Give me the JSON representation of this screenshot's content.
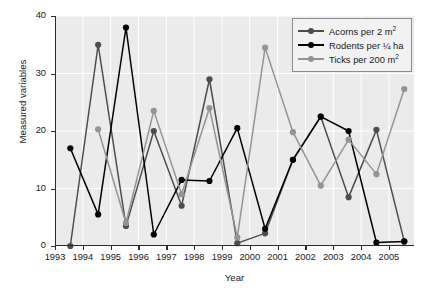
{
  "chart_data": {
    "type": "line",
    "title": "",
    "xlabel": "Year",
    "ylabel": "Measured variables",
    "xlim": [
      1993,
      2005.9
    ],
    "ylim": [
      0,
      40
    ],
    "yticks": [
      0,
      10,
      20,
      30,
      40
    ],
    "xticks": [
      1993,
      1994,
      1995,
      1996,
      1997,
      1998,
      1999,
      2000,
      2001,
      2002,
      2003,
      2004,
      2005
    ],
    "grid": true,
    "legend_position": "top-right",
    "series": [
      {
        "name": "Acorns per 2 m²",
        "legend_label": "Acorns per 2 m",
        "legend_sup": "2",
        "color": "#4d4d4d",
        "x": [
          1993.55,
          1994.55,
          1995.55,
          1996.55,
          1997.55,
          1998.55,
          1999.55,
          2000.55,
          2001.55,
          2002.55,
          2003.55,
          2004.55,
          2005.55
        ],
        "y": [
          0.0,
          35.0,
          3.5,
          20.0,
          7.0,
          29.0,
          0.5,
          2.2,
          15.0,
          22.5,
          8.5,
          20.2,
          0.8
        ]
      },
      {
        "name": "Rodents per ¼ ha",
        "legend_label_pre": "Rodents per ",
        "legend_frac": "¼",
        "legend_label_post": " ha",
        "color": "#000000",
        "x": [
          1993.55,
          1994.55,
          1995.55,
          1996.55,
          1997.55,
          1998.55,
          1999.55,
          2000.55,
          2001.55,
          2002.55,
          2003.55,
          2004.55,
          2005.55
        ],
        "y": [
          17.0,
          5.5,
          38.0,
          2.0,
          11.5,
          11.3,
          20.5,
          3.0,
          15.0,
          22.5,
          20.0,
          0.6,
          0.8
        ]
      },
      {
        "name": "Ticks per 200 m²",
        "legend_label": "Ticks per 200 m",
        "legend_sup": "2",
        "color": "#949494",
        "x": [
          1994.55,
          1995.55,
          1996.55,
          1997.55,
          1998.55,
          1999.55,
          2000.55,
          2001.55,
          2002.55,
          2003.55,
          2004.55,
          2005.55
        ],
        "y": [
          20.3,
          4.0,
          23.5,
          9.0,
          24.0,
          1.5,
          34.5,
          19.8,
          10.5,
          18.5,
          12.5,
          27.3
        ]
      }
    ]
  },
  "axes": {
    "y_tick_labels": [
      "0",
      "10",
      "20",
      "30",
      "40"
    ],
    "x_tick_labels": [
      "1993",
      "1994",
      "1995",
      "1996",
      "1997",
      "1998",
      "1999",
      "2000",
      "2001",
      "2002",
      "2003",
      "2004",
      "2005"
    ],
    "ylabel_text": "Measured variables",
    "xlabel_text": "Year"
  },
  "legend": {
    "items": [
      {
        "label": "Acorns per 2 m",
        "sup": "2",
        "color": "#4d4d4d"
      },
      {
        "label": "Rodents per ",
        "frac": "¼",
        "tail": " ha",
        "color": "#000000"
      },
      {
        "label": "Ticks per 200 m",
        "sup": "2",
        "color": "#949494"
      }
    ]
  }
}
